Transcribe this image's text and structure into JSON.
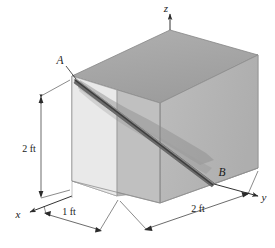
{
  "figure": {
    "type": "engineering-mechanics-diagram",
    "background_color": "#ffffff"
  },
  "axes": {
    "x": {
      "label": "x",
      "direction": "down-left"
    },
    "y": {
      "label": "y",
      "direction": "down-right"
    },
    "z": {
      "label": "z",
      "direction": "up"
    }
  },
  "points": {
    "A": {
      "label": "A",
      "description": "upper-left-front corner of box, start of diagonal"
    },
    "B": {
      "label": "B",
      "description": "lower-right corner of box, end of diagonal"
    }
  },
  "dimensions": [
    {
      "id": "height",
      "label": "2 ft",
      "axis": "z",
      "value": 2,
      "unit": "ft"
    },
    {
      "id": "depth",
      "label": "1 ft",
      "axis": "x",
      "value": 1,
      "unit": "ft"
    },
    {
      "id": "width",
      "label": "2 ft",
      "axis": "y",
      "value": 2,
      "unit": "ft"
    }
  ],
  "colors": {
    "top_face": "#a8a8a8",
    "right_face": "#b5b5b5",
    "front_face": "#bdbdbd",
    "left_face": "#e8e8e8",
    "outline": "#8a8a8a",
    "rod": "#6e6e6e",
    "shadow": "#9a9a9a",
    "label_text": "#1a1a1a",
    "axis_line": "#333333"
  }
}
